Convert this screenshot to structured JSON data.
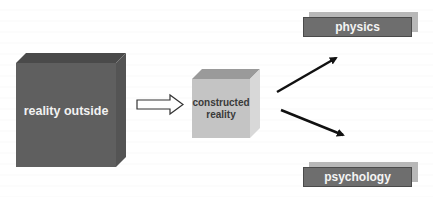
{
  "diagram": {
    "nodes": {
      "reality_outside": {
        "label": "reality outside",
        "color": "#5f5f5f"
      },
      "constructed_reality": {
        "label": "constructed reality",
        "line1": "constructed",
        "line2": "reality",
        "color": "#c4c4c4"
      },
      "physics": {
        "label": "physics",
        "color": "#6e6e6e"
      },
      "psychology": {
        "label": "psychology",
        "color": "#6e6e6e"
      }
    },
    "edges": [
      {
        "from": "reality_outside",
        "to": "constructed_reality",
        "style": "hollow-block-arrow"
      },
      {
        "from": "constructed_reality",
        "to": "physics",
        "style": "solid-arrow"
      },
      {
        "from": "constructed_reality",
        "to": "psychology",
        "style": "solid-arrow"
      }
    ]
  }
}
